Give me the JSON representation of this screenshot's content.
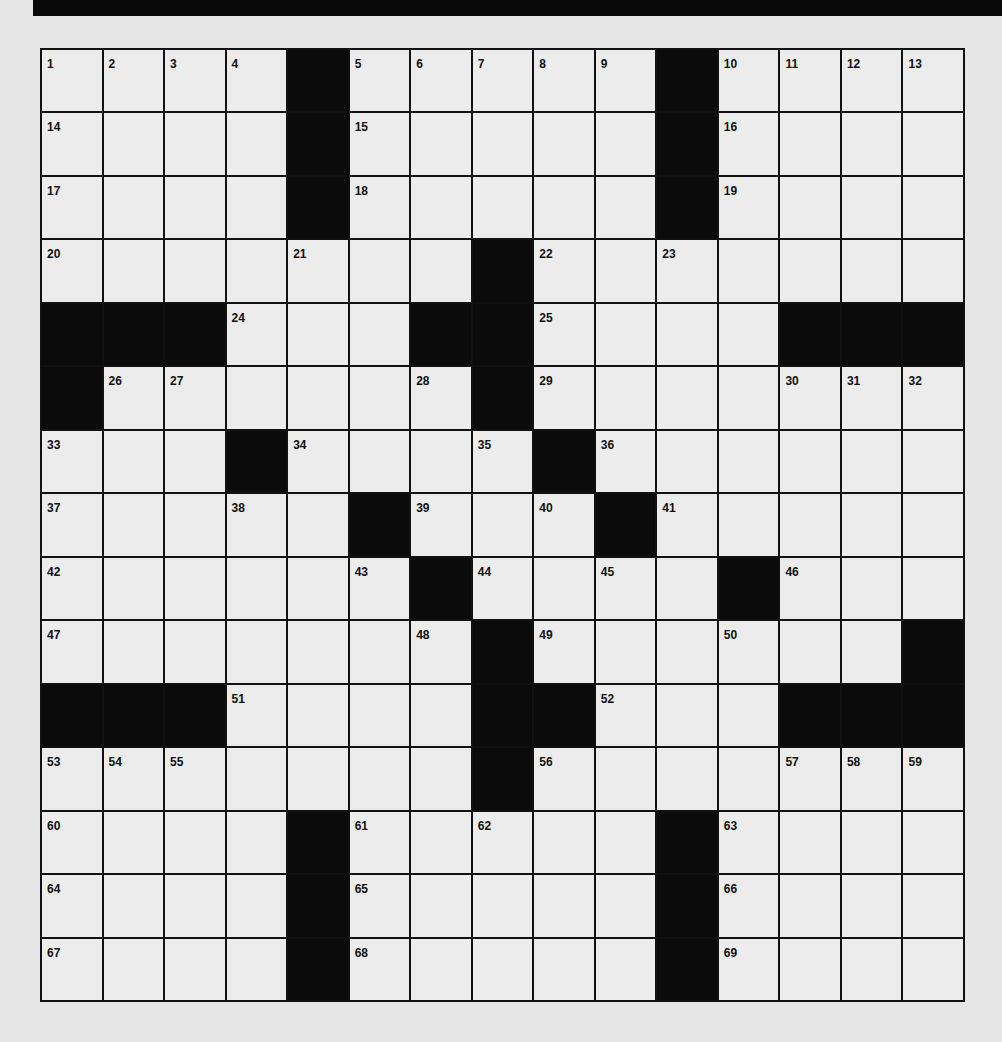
{
  "puzzle": {
    "rows": 15,
    "cols": 15,
    "colors": {
      "block": "#0b0b0b",
      "cell": "#ececec",
      "background": "#e6e6e6",
      "line": "#111111"
    },
    "layout": [
      "1 2 3 4 # 5 6 7 8 9 # 10 11 12 13",
      "14 . . . # 15 . . . . # 16 . . .",
      "17 . . . # 18 . . . . # 19 . . .",
      "20 . . . 21 . . # 22 . 23 . . . .",
      "# # # 24 . . # # 25 . . . # # #",
      "# 26 27 . . . 28 # 29 . . . 30 31 32",
      "33 . . # 34 . . 35 # 36 . . . . .",
      "37 . . 38 . # 39 . 40 # 41 . . . .",
      "42 . . . . 43 # 44 . 45 . # 46 . .",
      "47 . . . . . 48 # 49 . . 50 . . #",
      "# # # 51 . . . # # 52 . . # # #",
      "53 54 55 . . . . # 56 . . . 57 58 59",
      "60 . . . # 61 . 62 . . # 63 . . .",
      "64 . . . # 65 . . . . # 66 . . .",
      "67 . . . # 68 . . . . # 69 . . ."
    ]
  }
}
